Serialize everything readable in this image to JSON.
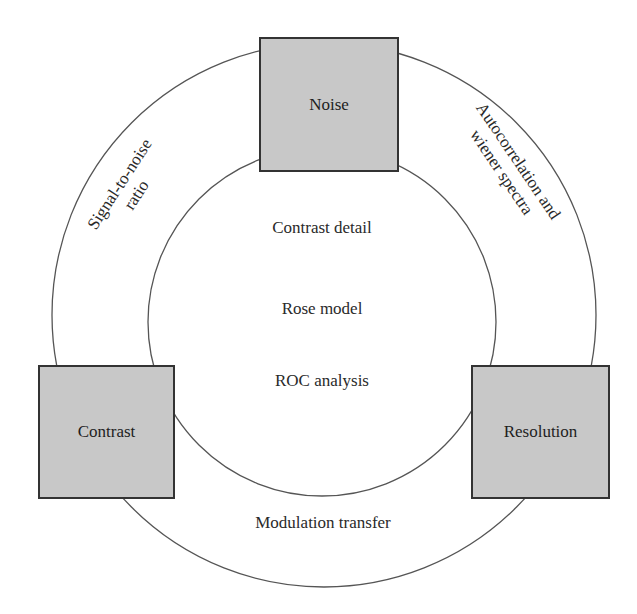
{
  "diagram": {
    "colors": {
      "box_fill": "#c8c8c8",
      "box_border": "#333333",
      "ring_stroke": "#555555"
    },
    "nodes": {
      "noise": {
        "label": "Noise"
      },
      "contrast": {
        "label": "Contrast"
      },
      "resolution": {
        "label": "Resolution"
      }
    },
    "ring_labels": {
      "left": {
        "line1": "Signal-to-noise",
        "line2": "ratio"
      },
      "right": {
        "line1": "Autocorrelation and",
        "line2": "wiener spectra"
      },
      "bottom": "Modulation transfer"
    },
    "inner_labels": [
      "Contrast detail",
      "Rose model",
      "ROC analysis"
    ]
  }
}
